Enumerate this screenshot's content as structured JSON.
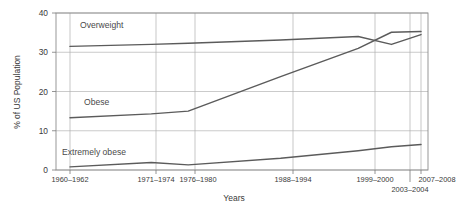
{
  "chart_data": {
    "type": "line",
    "title": "",
    "xlabel": "Years",
    "ylabel": "% of US Population",
    "categories": [
      "1960–1962",
      "1971–1974",
      "1976–1980",
      "1988–1994",
      "1999–2000",
      "2003–2004",
      "2007–2008"
    ],
    "x_positions": [
      0,
      11,
      16,
      28.5,
      39,
      43.5,
      47.5
    ],
    "ylim": [
      0,
      40
    ],
    "yticks": [
      0,
      10,
      20,
      30,
      40
    ],
    "ytick_labels": [
      "0",
      "10",
      "20",
      "30",
      "40"
    ],
    "grid": true,
    "legend_position": "inline-labels",
    "series": [
      {
        "name": "Overweight",
        "label": "Overweight",
        "values": [
          31.5,
          32.0,
          32.3,
          33.1,
          34.0,
          32.0,
          34.5
        ],
        "color": "#5b5b5b"
      },
      {
        "name": "Obese",
        "label": "Obese",
        "values": [
          13.3,
          14.3,
          15.0,
          23.8,
          31.0,
          35.1,
          35.3
        ],
        "color": "#5b5b5b"
      },
      {
        "name": "Extremely obese",
        "label": "Extremely obese",
        "values": [
          0.8,
          1.9,
          1.3,
          3.0,
          4.9,
          5.9,
          6.5
        ],
        "color": "#5b5b5b"
      }
    ],
    "annotations": [
      {
        "text": "Overweight",
        "x": 6.5,
        "y": 36.0
      },
      {
        "text": "Obese",
        "x": 7.5,
        "y": 17.8
      },
      {
        "text": "Extremely obese",
        "x": 4.5,
        "y": 5.2
      }
    ]
  }
}
